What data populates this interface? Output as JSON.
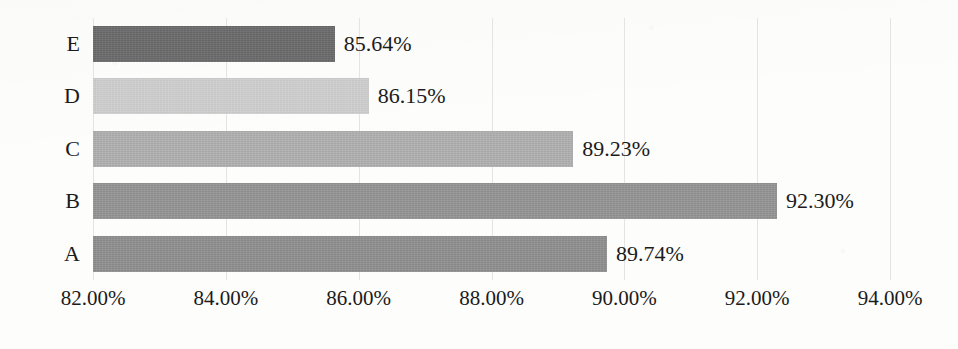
{
  "chart_data": {
    "type": "bar",
    "orientation": "horizontal",
    "title": "",
    "subtitle": "",
    "xlabel": "",
    "ylabel": "",
    "categories": [
      "E",
      "D",
      "C",
      "B",
      "A"
    ],
    "values": [
      85.64,
      86.15,
      89.23,
      92.3,
      89.74
    ],
    "value_labels": [
      "85.64%",
      "86.15%",
      "89.23%",
      "92.30%",
      "89.74%"
    ],
    "xlim": [
      82.0,
      94.0
    ],
    "xtick_values": [
      82.0,
      84.0,
      86.0,
      88.0,
      90.0,
      92.0,
      94.0
    ],
    "xtick_labels": [
      "82.00%",
      "84.00%",
      "86.00%",
      "88.00%",
      "90.00%",
      "92.00%",
      "94.00%"
    ],
    "grid": true,
    "grid_axis": "x",
    "legend": false,
    "legend_position": "none",
    "bar_colors": [
      "#6a6a6a",
      "#d0d0d0",
      "#b0b0b0",
      "#949494",
      "#8f8f8f"
    ],
    "background_color": "#fdfdfc",
    "gridline_color": "#e4e4e2",
    "text_color": "#1b1b1b",
    "bars": [
      {
        "category": "E",
        "value": 85.64,
        "label": "85.64%",
        "color": "#6a6a6a"
      },
      {
        "category": "D",
        "value": 86.15,
        "label": "86.15%",
        "color": "#d0d0d0"
      },
      {
        "category": "C",
        "value": 89.23,
        "label": "89.23%",
        "color": "#b0b0b0"
      },
      {
        "category": "B",
        "value": 92.3,
        "label": "92.30%",
        "color": "#949494"
      },
      {
        "category": "A",
        "value": 89.74,
        "label": "89.74%",
        "color": "#8f8f8f"
      }
    ]
  }
}
